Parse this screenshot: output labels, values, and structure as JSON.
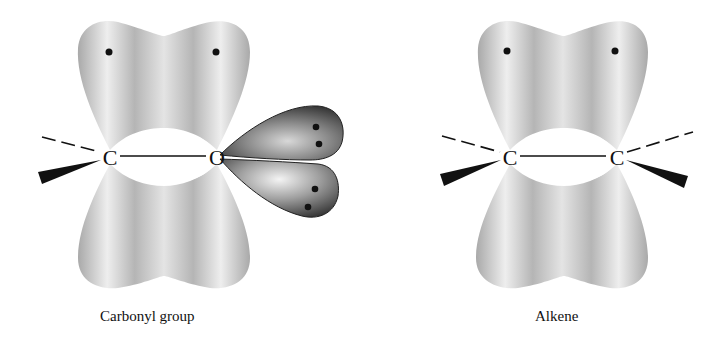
{
  "figure": {
    "panels": [
      {
        "id": "carbonyl",
        "caption": "Carbonyl group",
        "atoms": [
          {
            "symbol": "C",
            "x": 110,
            "y": 157
          },
          {
            "symbol": "O",
            "x": 217,
            "y": 157
          }
        ],
        "pi_electrons": 2,
        "lone_pair_electrons": 4
      },
      {
        "id": "alkene",
        "caption": "Alkene",
        "atoms": [
          {
            "symbol": "C",
            "x": 510,
            "y": 157
          },
          {
            "symbol": "C",
            "x": 617,
            "y": 157
          }
        ],
        "pi_electrons": 2
      }
    ],
    "colors": {
      "pi_orbital": "#b4b4b4",
      "pi_highlight": "#f2f2f2",
      "lone_pair_orbital": "#3a3a3a",
      "bond_line": "#111111",
      "electron": "#111111"
    }
  }
}
